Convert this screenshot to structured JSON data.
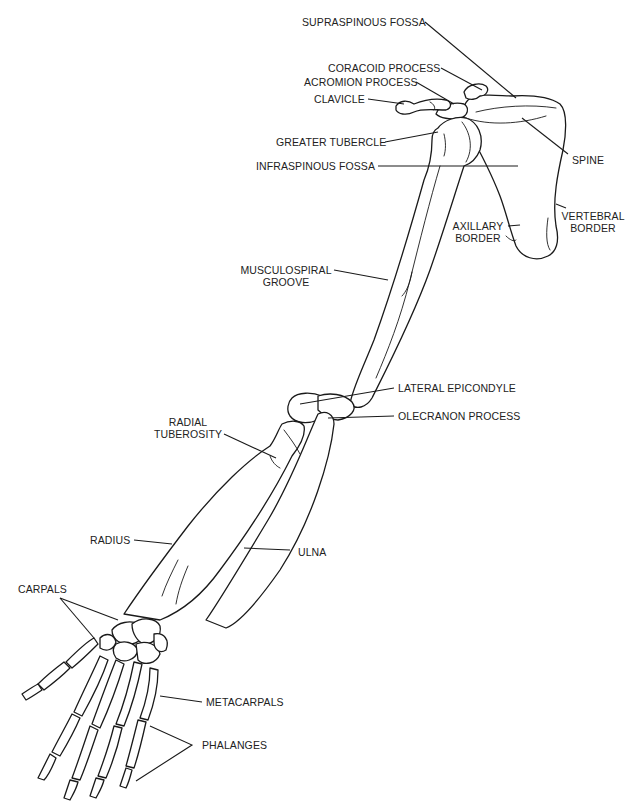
{
  "diagram": {
    "labels": {
      "supraspinous_fossa": "SUPRASPINOUS FOSSA",
      "coracoid_process": "CORACOID PROCESS",
      "acromion_process": "ACROMION PROCESS",
      "clavicle": "CLAVICLE",
      "greater_tubercle": "GREATER TUBERCLE",
      "infraspinous_fossa": "INFRASPINOUS FOSSA",
      "spine": "SPINE",
      "axillary_border_1": "AXILLARY",
      "axillary_border_2": "BORDER",
      "vertebral_border_1": "VERTEBRAL",
      "vertebral_border_2": "BORDER",
      "musculospiral_groove_1": "MUSCULOSPIRAL",
      "musculospiral_groove_2": "GROOVE",
      "lateral_epicondyle": "LATERAL EPICONDYLE",
      "olecranon_process": "OLECRANON PROCESS",
      "radial_tuberosity_1": "RADIAL",
      "radial_tuberosity_2": "TUBEROSITY",
      "radius": "RADIUS",
      "ulna": "ULNA",
      "carpals": "CARPALS",
      "metacarpals": "METACARPALS",
      "phalanges": "PHALANGES"
    },
    "colors": {
      "line": "#1a1a1a",
      "text": "#222222",
      "background": "#ffffff"
    }
  }
}
